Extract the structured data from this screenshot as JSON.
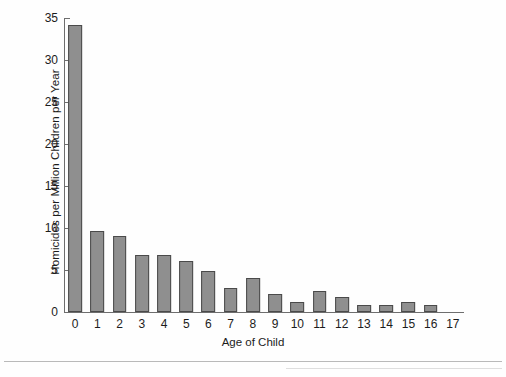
{
  "chart_data": {
    "type": "bar",
    "title": "",
    "xlabel": "Age of Child",
    "ylabel": "Homicides per Million Children per Year",
    "categories": [
      "0",
      "1",
      "2",
      "3",
      "4",
      "5",
      "6",
      "7",
      "8",
      "9",
      "10",
      "11",
      "12",
      "13",
      "14",
      "15",
      "16",
      "17"
    ],
    "values": [
      34.2,
      9.7,
      9.0,
      6.8,
      6.8,
      6.1,
      4.9,
      2.9,
      4.0,
      2.1,
      1.2,
      2.5,
      1.8,
      0.8,
      0.8,
      1.2,
      0.8,
      0
    ],
    "ylim": [
      0,
      35
    ],
    "yticks": [
      0,
      5,
      10,
      15,
      20,
      25,
      30,
      35
    ],
    "ytick_labels": [
      "0",
      "5",
      "10",
      "15",
      "20",
      "25",
      "30",
      "35"
    ],
    "xlim_categories": 18,
    "grid": false,
    "legend": null,
    "bar_color": "#8f8f8f",
    "bar_edge_color": "#4a4a4a",
    "axis_color": "#6e6e6e",
    "background_color": "#fefefe"
  }
}
